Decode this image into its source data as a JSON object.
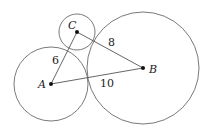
{
  "diagram": {
    "points": {
      "A": {
        "label": "A",
        "x": 51,
        "y": 84
      },
      "B": {
        "label": "B",
        "x": 143,
        "y": 68
      },
      "C": {
        "label": "C",
        "x": 77,
        "y": 32
      }
    },
    "circles": [
      {
        "center": "A",
        "r": 37
      },
      {
        "center": "B",
        "r": 56
      },
      {
        "center": "C",
        "r": 18
      }
    ],
    "segments": [
      {
        "from": "A",
        "to": "C",
        "length_label": "6"
      },
      {
        "from": "C",
        "to": "B",
        "length_label": "8"
      },
      {
        "from": "A",
        "to": "B",
        "length_label": "10"
      }
    ],
    "labels": {
      "A": "A",
      "B": "B",
      "C": "C",
      "AC": "6",
      "CB": "8",
      "AB": "10"
    }
  }
}
